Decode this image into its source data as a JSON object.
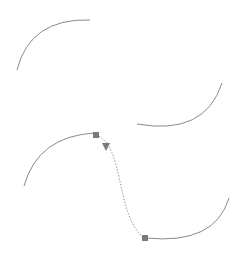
{
  "canvas": {
    "width": 243,
    "height": 256,
    "background": "#ffffff"
  },
  "colors": {
    "curve": "#8a8a8a",
    "blend": "#9a9a9a",
    "handle": "#7a7a7a"
  },
  "shapes": [
    {
      "name": "arc-top-left",
      "d": "M 17 70 Q 30 18 90 20"
    },
    {
      "name": "arc-top-right",
      "d": "M 137 124 Q 205 136 222 83"
    },
    {
      "name": "arc-bottom-left",
      "d": "M 24 186 Q 38 136 95 133"
    },
    {
      "name": "arc-bottom-right",
      "d": "M 146 238 Q 215 245 229 198"
    }
  ],
  "blend": {
    "name": "blend-curve",
    "d": "M 96 135 C 125 145, 115 215, 144 238"
  },
  "handles": [
    {
      "name": "blend-start-handle",
      "x": 96,
      "y": 135
    },
    {
      "name": "blend-end-handle",
      "x": 145,
      "y": 238
    }
  ],
  "direction_marker": {
    "name": "direction-arrow",
    "x": 106,
    "y": 147
  }
}
